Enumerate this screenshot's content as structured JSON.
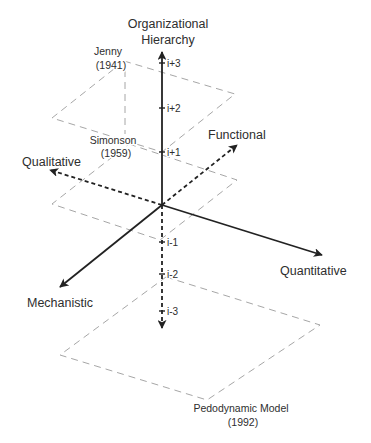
{
  "diagram": {
    "title": {
      "line1": "Organizational",
      "line2": "Hierarchy"
    },
    "vertical_axis": {
      "name": "Organizational Hierarchy",
      "upper_style": "solid",
      "lower_style": "dashed",
      "ticks": [
        "i+3",
        "i+2",
        "i+1",
        "i-1",
        "i-2",
        "i-3"
      ]
    },
    "axes": {
      "functional": {
        "label": "Functional",
        "style": "dashed"
      },
      "qualitative": {
        "label": "Qualitative",
        "style": "dashed"
      },
      "quantitative": {
        "label": "Quantitative",
        "style": "solid"
      },
      "mechanistic": {
        "label": "Mechanistic",
        "style": "solid"
      }
    },
    "planes": [
      {
        "name": "Jenny",
        "year": "(1941)",
        "level": "upper"
      },
      {
        "name": "Simonson",
        "year": "(1959)",
        "level": "middle"
      },
      {
        "name": "Pedodynamic Model",
        "year": "(1992)",
        "level": "lower"
      }
    ],
    "colors": {
      "axis": "#222222",
      "plane_outline": "#9c9c9c",
      "text": "#2e2e2e",
      "background": "#ffffff"
    }
  }
}
